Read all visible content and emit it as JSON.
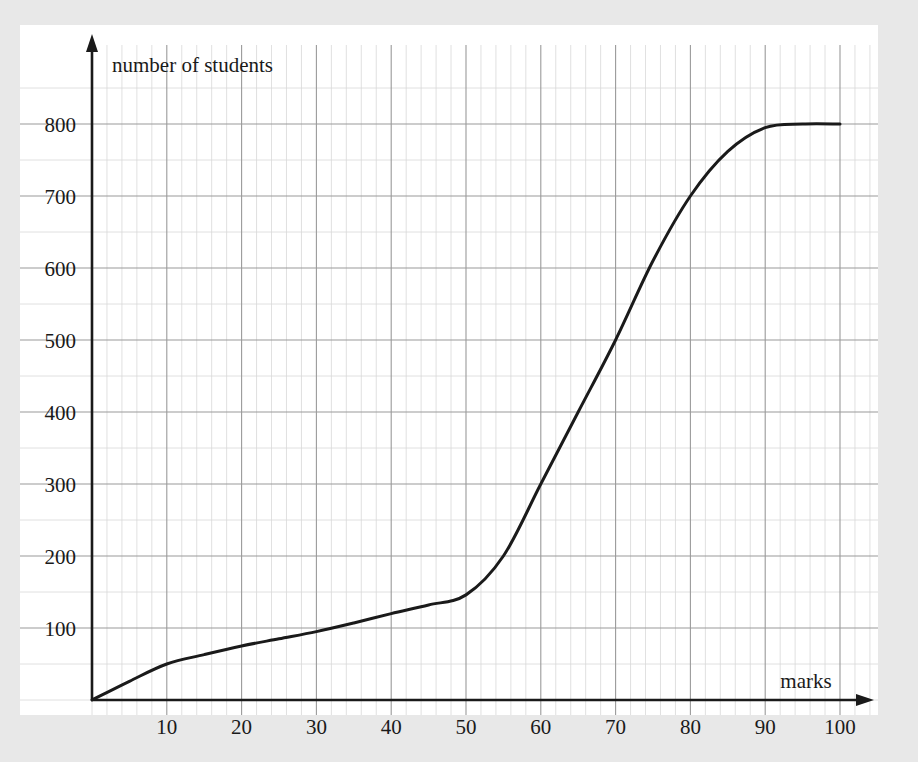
{
  "figure": {
    "background_color": "#e8e8e8",
    "plot_background_color": "#ffffff",
    "axis_color": "#1a1a1a",
    "curve_color": "#1a1a1a",
    "major_grid_color": "#9a9a9a",
    "minor_grid_color": "#d8d8d8"
  },
  "chart_data": {
    "type": "line",
    "title": "",
    "subtitle": "",
    "xlabel": "marks",
    "ylabel": "number of students",
    "xlim": [
      0,
      104
    ],
    "ylim": [
      0,
      870
    ],
    "xticks": [
      10,
      20,
      30,
      40,
      50,
      60,
      70,
      80,
      90,
      100
    ],
    "xtick_labels": [
      "10",
      "20",
      "30",
      "40",
      "50",
      "60",
      "70",
      "80",
      "90",
      "100"
    ],
    "yticks": [
      100,
      200,
      300,
      400,
      500,
      600,
      700,
      800
    ],
    "ytick_labels": [
      "100",
      "200",
      "300",
      "400",
      "500",
      "600",
      "700",
      "800"
    ],
    "x_minor_step": 2,
    "y_minor_step": 50,
    "grid": true,
    "legend": "none",
    "axis_arrows": true,
    "series": [
      {
        "name": "cumulative frequency",
        "x": [
          0,
          5,
          10,
          15,
          20,
          25,
          30,
          35,
          40,
          45,
          50,
          55,
          60,
          65,
          70,
          75,
          80,
          85,
          90,
          95,
          100
        ],
        "values": [
          0,
          26,
          50,
          63,
          75,
          85,
          95,
          107,
          120,
          132,
          146,
          200,
          300,
          400,
          500,
          610,
          700,
          762,
          795,
          800,
          800
        ]
      }
    ],
    "annotations": [
      {
        "label": "number of students",
        "position": "top-left-inside"
      },
      {
        "label": "marks",
        "position": "bottom-right-inside"
      }
    ]
  }
}
